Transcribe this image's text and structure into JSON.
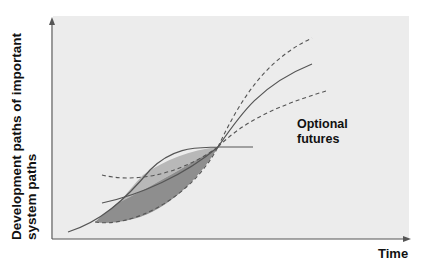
{
  "diagram": {
    "y_axis_label_line1": "Development paths of important",
    "y_axis_label_line2": "system paths",
    "x_axis_label": "Time",
    "annotation_line1": "Optional",
    "annotation_line2": "futures",
    "colors": {
      "background_panel": "#ececec",
      "axis": "#555555",
      "curve": "#555555",
      "dark_fill": "#8e8e8e",
      "light_fill": "#bdbdbd"
    },
    "elements": [
      "y-axis-arrow",
      "x-axis-arrow",
      "main-s-curve-solid",
      "past-dashed-paths",
      "shaded-lens-region-dark",
      "shaded-lens-region-light",
      "horizontal-continuation-line",
      "upper-dashed-future",
      "central-solid-future",
      "lower-dashed-future"
    ]
  }
}
